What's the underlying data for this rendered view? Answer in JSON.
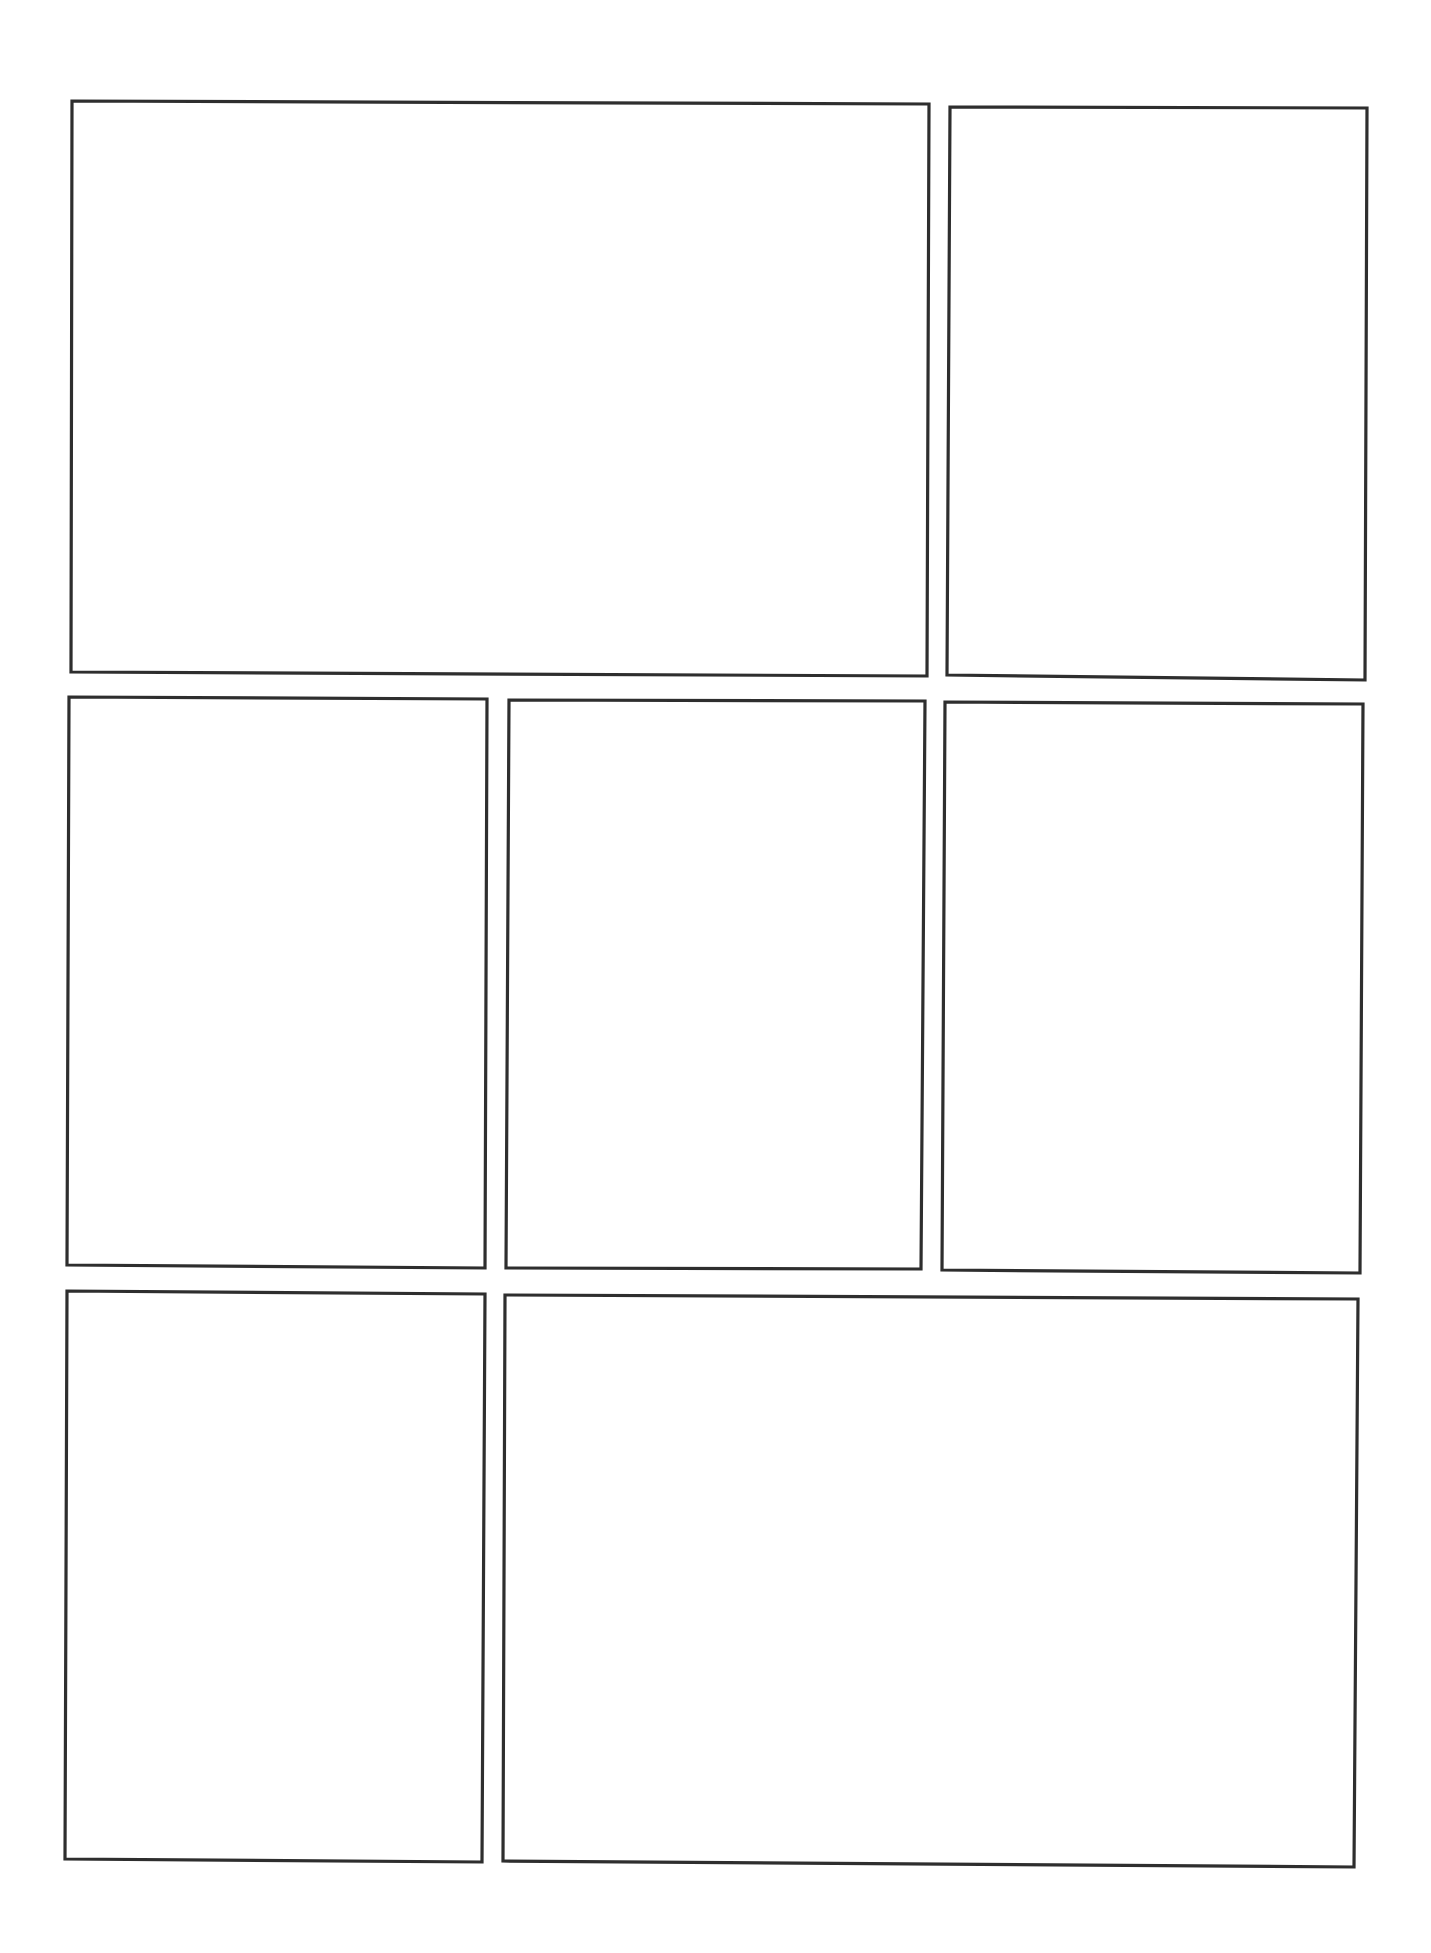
{
  "page": {
    "type": "comic-page-template",
    "background": "#ffffff",
    "stroke_color": "#2e2e2e",
    "rows": 3
  },
  "panels": [
    {
      "id": "panel-1",
      "row": 1,
      "points": [
        [
          72,
          101
        ],
        [
          929,
          104
        ],
        [
          927,
          676
        ],
        [
          71,
          672
        ]
      ]
    },
    {
      "id": "panel-2",
      "row": 1,
      "points": [
        [
          950,
          107
        ],
        [
          1367,
          108
        ],
        [
          1365,
          680
        ],
        [
          947,
          675
        ]
      ]
    },
    {
      "id": "panel-3",
      "row": 2,
      "points": [
        [
          69,
          697
        ],
        [
          487,
          699
        ],
        [
          485,
          1268
        ],
        [
          67,
          1265
        ]
      ]
    },
    {
      "id": "panel-4",
      "row": 2,
      "points": [
        [
          509,
          700
        ],
        [
          925,
          701
        ],
        [
          921,
          1269
        ],
        [
          506,
          1268
        ]
      ]
    },
    {
      "id": "panel-5",
      "row": 2,
      "points": [
        [
          945,
          702
        ],
        [
          1363,
          704
        ],
        [
          1360,
          1273
        ],
        [
          942,
          1270
        ]
      ]
    },
    {
      "id": "panel-6",
      "row": 3,
      "points": [
        [
          67,
          1291
        ],
        [
          485,
          1294
        ],
        [
          482,
          1862
        ],
        [
          65,
          1859
        ]
      ]
    },
    {
      "id": "panel-7",
      "row": 3,
      "points": [
        [
          505,
          1295
        ],
        [
          1358,
          1299
        ],
        [
          1354,
          1867
        ],
        [
          503,
          1861
        ]
      ]
    }
  ]
}
